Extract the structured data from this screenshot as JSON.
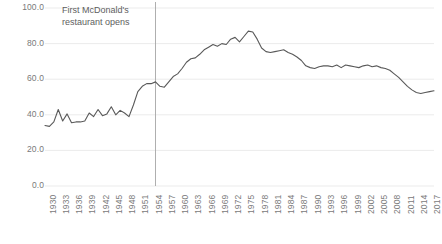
{
  "chart_data": {
    "type": "line",
    "title": "",
    "subtitle": "",
    "xlabel": "",
    "ylabel": "",
    "xlim": [
      1930,
      2018
    ],
    "ylim": [
      0,
      100
    ],
    "grid": true,
    "legend": "none",
    "y_ticks": [
      "100.0",
      "80.0",
      "60.0",
      "40.0",
      "20.0",
      "0.0"
    ],
    "y_tick_values": [
      100,
      80,
      60,
      40,
      20,
      0
    ],
    "x_ticks": [
      "1930",
      "1933",
      "1936",
      "1939",
      "1942",
      "1945",
      "1948",
      "1951",
      "1954",
      "1957",
      "1960",
      "1963",
      "1966",
      "1969",
      "1972",
      "1975",
      "1978",
      "1981",
      "1984",
      "1987",
      "1990",
      "1993",
      "1996",
      "1999",
      "2002",
      "2005",
      "2008",
      "2011",
      "2014",
      "2017"
    ],
    "x_tick_values": [
      1930,
      1933,
      1936,
      1939,
      1942,
      1945,
      1948,
      1951,
      1954,
      1957,
      1960,
      1963,
      1966,
      1969,
      1972,
      1975,
      1978,
      1981,
      1984,
      1987,
      1990,
      1993,
      1996,
      1999,
      2002,
      2005,
      2008,
      2011,
      2014,
      2017
    ],
    "line_color": "#595959",
    "annotations": [
      {
        "name": "mcdonalds-opening",
        "text_line1": "First McDonald's",
        "text_line2": "restaurant opens",
        "x_value": 1955,
        "marker": "vertical-line",
        "marker_color": "#a6a6a6"
      }
    ],
    "x": [
      1930,
      1931,
      1932,
      1933,
      1934,
      1935,
      1936,
      1937,
      1938,
      1939,
      1940,
      1941,
      1942,
      1943,
      1944,
      1945,
      1946,
      1947,
      1948,
      1949,
      1950,
      1951,
      1952,
      1953,
      1954,
      1955,
      1956,
      1957,
      1958,
      1959,
      1960,
      1961,
      1962,
      1963,
      1964,
      1965,
      1966,
      1967,
      1968,
      1969,
      1970,
      1971,
      1972,
      1973,
      1974,
      1975,
      1976,
      1977,
      1978,
      1979,
      1980,
      1981,
      1982,
      1983,
      1984,
      1985,
      1986,
      1987,
      1988,
      1989,
      1990,
      1991,
      1992,
      1993,
      1994,
      1995,
      1996,
      1997,
      1998,
      1999,
      2000,
      2001,
      2002,
      2003,
      2004,
      2005,
      2006,
      2007,
      2008,
      2009,
      2010,
      2011,
      2012,
      2013,
      2014,
      2015,
      2016,
      2017,
      2018
    ],
    "values": [
      34.0,
      33.5,
      36.0,
      43.0,
      36.5,
      40.5,
      35.5,
      36.0,
      36.0,
      36.5,
      41.0,
      39.0,
      43.0,
      39.5,
      40.5,
      44.5,
      40.0,
      42.5,
      41.0,
      39.0,
      45.5,
      53.0,
      56.0,
      57.5,
      57.5,
      58.5,
      56.0,
      55.5,
      58.5,
      61.5,
      63.0,
      66.0,
      69.5,
      71.5,
      72.0,
      74.0,
      76.5,
      78.0,
      79.5,
      78.5,
      80.0,
      79.5,
      82.5,
      83.5,
      81.0,
      84.0,
      87.0,
      86.5,
      82.5,
      77.5,
      75.5,
      75.0,
      75.5,
      76.0,
      76.5,
      75.0,
      74.0,
      72.5,
      70.5,
      67.5,
      66.5,
      66.0,
      67.0,
      67.5,
      67.5,
      67.0,
      68.0,
      66.5,
      68.0,
      67.5,
      67.0,
      66.5,
      67.5,
      68.0,
      67.0,
      67.5,
      66.5,
      66.0,
      65.0,
      63.0,
      61.0,
      58.5,
      56.0,
      54.0,
      52.5,
      52.0,
      52.5,
      53.0,
      53.5
    ]
  }
}
